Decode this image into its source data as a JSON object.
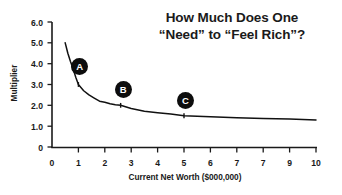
{
  "title": {
    "line1": "How Much Does One",
    "line2": "“Need” to “Feel Rich”?"
  },
  "axes": {
    "xlabel": "Current Net Worth ($000,000)",
    "ylabel": "Multiplier",
    "xticks": [
      "0",
      "1",
      "2",
      "3",
      "4",
      "5",
      "6",
      "7",
      "7",
      "9",
      "10"
    ],
    "yticks": [
      "6.0",
      "5.0",
      "4.0",
      "3.0",
      "2.0",
      "1.0",
      "0"
    ]
  },
  "markers": [
    {
      "label": "A"
    },
    {
      "label": "B"
    },
    {
      "label": "C"
    }
  ],
  "chart_data": {
    "type": "line",
    "title": "How Much Does One “Need” to “Feel Rich”?",
    "xlabel": "Current Net Worth ($000,000)",
    "ylabel": "Multiplier",
    "xlim": [
      0,
      10
    ],
    "ylim": [
      0,
      6
    ],
    "xtick_values": [
      0,
      1,
      2,
      3,
      4,
      5,
      6,
      7,
      8,
      9,
      10
    ],
    "xtick_labels": [
      "0",
      "1",
      "2",
      "3",
      "4",
      "5",
      "6",
      "7",
      "7",
      "9",
      "10"
    ],
    "ytick_values": [
      0,
      1,
      2,
      3,
      4,
      5,
      6
    ],
    "ytick_labels": [
      "0",
      "1.0",
      "2.0",
      "3.0",
      "4.0",
      "5.0",
      "6.0"
    ],
    "grid": false,
    "legend": false,
    "line_color": "#111111",
    "series": [
      {
        "name": "Multiplier needed to feel rich",
        "x": [
          0.5,
          0.6,
          0.7,
          0.8,
          0.9,
          1.0,
          1.2,
          1.4,
          1.6,
          1.8,
          2.0,
          2.2,
          2.4,
          2.6,
          3.0,
          3.5,
          4.0,
          4.5,
          5.0,
          6.0,
          7.0,
          8.0,
          9.0,
          10.0
        ],
        "y": [
          5.0,
          4.5,
          4.1,
          3.75,
          3.35,
          3.0,
          2.7,
          2.5,
          2.35,
          2.2,
          2.15,
          2.08,
          2.03,
          2.0,
          1.85,
          1.72,
          1.65,
          1.58,
          1.5,
          1.45,
          1.4,
          1.37,
          1.34,
          1.3
        ]
      }
    ],
    "annotations": [
      {
        "label": "A",
        "x": 1.0,
        "y": 3.0,
        "marker_x": 1.05,
        "marker_y": 3.85
      },
      {
        "label": "B",
        "x": 2.6,
        "y": 2.0,
        "marker_x": 2.7,
        "marker_y": 2.75
      },
      {
        "label": "C",
        "x": 5.0,
        "y": 1.5,
        "marker_x": 5.05,
        "marker_y": 2.25
      }
    ]
  }
}
